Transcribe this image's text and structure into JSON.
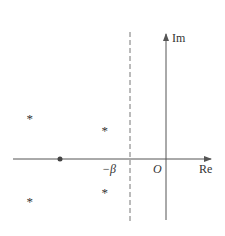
{
  "diagram": {
    "type": "complex-plane-pole-plot",
    "axes": {
      "real_label": "Re",
      "imag_label": "Im",
      "origin_label": "O"
    },
    "dashed_line": {
      "label": "−β",
      "description": "vertical line Re = −β"
    },
    "poles": [
      {
        "marker": "*",
        "position": "upper-left"
      },
      {
        "marker": "*",
        "position": "upper-near"
      },
      {
        "marker": "•",
        "position": "on-real-axis"
      },
      {
        "marker": "*",
        "position": "lower-left"
      },
      {
        "marker": "*",
        "position": "lower-near"
      }
    ],
    "colors": {
      "axis": "#555555",
      "dashed": "#777777",
      "marker": "#444444"
    }
  }
}
